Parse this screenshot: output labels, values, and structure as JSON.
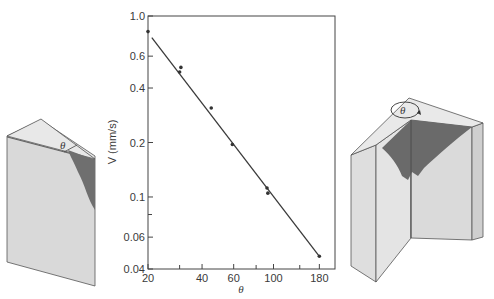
{
  "chart_data": {
    "type": "scatter",
    "title": "",
    "xlabel": "θ",
    "ylabel": "V (mm/s)",
    "xscale": "log",
    "yscale": "log",
    "xlim": [
      20,
      220
    ],
    "ylim": [
      0.04,
      1.0
    ],
    "x_ticks": [
      20,
      40,
      60,
      100,
      180
    ],
    "x_minor_ticks": [
      30,
      80,
      140
    ],
    "y_ticks": [
      0.04,
      0.06,
      0.1,
      0.2,
      0.4,
      0.6,
      1.0
    ],
    "y_tick_labels": [
      "0.04",
      "0.06",
      "0.1",
      "0.2",
      "0.4",
      "0.6",
      "1.0"
    ],
    "y_minor_ticks": [
      0.08
    ],
    "grid": false,
    "series": [
      {
        "name": "measured",
        "points": [
          {
            "x": 20,
            "y": 0.82
          },
          {
            "x": 30,
            "y": 0.49
          },
          {
            "x": 30.5,
            "y": 0.52
          },
          {
            "x": 45,
            "y": 0.31
          },
          {
            "x": 59,
            "y": 0.195
          },
          {
            "x": 92,
            "y": 0.112
          },
          {
            "x": 93,
            "y": 0.105
          },
          {
            "x": 180,
            "y": 0.047
          }
        ]
      }
    ],
    "fit_line": {
      "x": [
        21,
        180
      ],
      "y": [
        0.76,
        0.047
      ]
    }
  },
  "illustrations": {
    "left_wedge_label": "θ",
    "right_corner_label": "θ"
  }
}
